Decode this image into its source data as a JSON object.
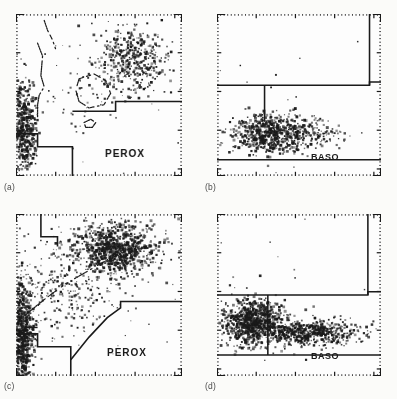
{
  "figure": {
    "background_color": "#fbfbf9",
    "ink_color": "#1a1a1a",
    "layout": "2x2 grid of scatter cytograms"
  },
  "panels": [
    {
      "id": "a",
      "caption": "(a)",
      "channel_label": "PEROX",
      "description": "Peroxidase cytogram, normal-type sample"
    },
    {
      "id": "b",
      "caption": "(b)",
      "channel_label": "BASO",
      "description": "Basophil/lobularity cytogram, normal-type sample"
    },
    {
      "id": "c",
      "caption": "(c)",
      "channel_label": "PEROX",
      "description": "Peroxidase cytogram, abnormal sample"
    },
    {
      "id": "d",
      "caption": "(d)",
      "channel_label": "BASO",
      "description": "Basophil/lobularity cytogram, abnormal sample"
    }
  ],
  "chart_data": [
    {
      "type": "scatter",
      "panel": "a",
      "title": "(a) PEROX",
      "xlabel": "Peroxidase activity",
      "ylabel": "Light scatter (size)",
      "xlim": [
        0,
        100
      ],
      "ylim": [
        0,
        100
      ],
      "grid": false,
      "axis_style": "dotted tick border on all four sides",
      "clusters": [
        {
          "name": "lymphocytes",
          "cx": 5,
          "cy": 30,
          "sx": 3.5,
          "sy": 14,
          "n": 460,
          "density": "very-high"
        },
        {
          "name": "neutrophils",
          "cx": 70,
          "cy": 72,
          "sx": 11,
          "sy": 10,
          "n": 420,
          "density": "high"
        },
        {
          "name": "monocytes",
          "cx": 40,
          "cy": 48,
          "sx": 13,
          "sy": 9,
          "n": 40,
          "density": "low"
        },
        {
          "name": "noise",
          "cx": 45,
          "cy": 60,
          "sx": 28,
          "sy": 26,
          "n": 55,
          "density": "sparse"
        }
      ],
      "gates": [
        {
          "name": "lymph-mono-gate-step",
          "type": "polyline",
          "points": [
            [
              0,
              26
            ],
            [
              13,
              26
            ],
            [
              13,
              18
            ],
            [
              34,
              18
            ],
            [
              34,
              0
            ]
          ]
        },
        {
          "name": "noise-threshold-line",
          "type": "polyline",
          "points": [
            [
              34,
              40
            ],
            [
              60,
              40
            ],
            [
              60,
              46
            ],
            [
              100,
              46
            ]
          ]
        },
        {
          "name": "lmne-left-contour",
          "type": "polyline",
          "points": [
            [
              13,
              82
            ],
            [
              16,
              74
            ],
            [
              15,
              62
            ],
            [
              17,
              55
            ],
            [
              14,
              50
            ],
            [
              13,
              44
            ],
            [
              13,
              36
            ]
          ]
        },
        {
          "name": "upper-contour",
          "type": "polyline",
          "points": [
            [
              17,
              96
            ],
            [
              19,
              90
            ],
            [
              22,
              84
            ],
            [
              24,
              78
            ]
          ]
        },
        {
          "name": "mono-contour-loop",
          "type": "closed",
          "points": [
            [
              38,
              60
            ],
            [
              47,
              63
            ],
            [
              54,
              59
            ],
            [
              57,
              51
            ],
            [
              53,
              44
            ],
            [
              44,
              42
            ],
            [
              38,
              46
            ],
            [
              36,
              53
            ]
          ]
        },
        {
          "name": "small-contour-loop",
          "type": "closed",
          "points": [
            [
              41,
              33
            ],
            [
              45,
              35
            ],
            [
              48,
              33
            ],
            [
              46,
              30
            ],
            [
              42,
              30
            ]
          ]
        }
      ]
    },
    {
      "type": "scatter",
      "panel": "b",
      "title": "(b) BASO",
      "xlabel": "Light scatter (lobularity)",
      "ylabel": "Nuclear density",
      "xlim": [
        0,
        100
      ],
      "ylim": [
        0,
        100
      ],
      "grid": false,
      "axis_style": "dotted tick border on all four sides",
      "clusters": [
        {
          "name": "mononuclear-polymorphonuclear",
          "cx": 33,
          "cy": 26,
          "sx": 12,
          "sy": 6,
          "n": 620,
          "density": "very-high"
        },
        {
          "name": "tail",
          "cx": 55,
          "cy": 25,
          "sx": 13,
          "sy": 4,
          "n": 120,
          "density": "medium"
        },
        {
          "name": "noise",
          "cx": 45,
          "cy": 45,
          "sx": 30,
          "sy": 22,
          "n": 22,
          "density": "sparse"
        }
      ],
      "gates": [
        {
          "name": "baso-horizontal-gate",
          "type": "polyline",
          "points": [
            [
              0,
              56
            ],
            [
              93,
              56
            ],
            [
              93,
              58
            ],
            [
              100,
              58
            ]
          ]
        },
        {
          "name": "mn-pmn-divider",
          "type": "polyline",
          "points": [
            [
              29,
              56
            ],
            [
              29,
              34
            ]
          ]
        },
        {
          "name": "baso-vertical-gate",
          "type": "polyline",
          "points": [
            [
              93,
              100
            ],
            [
              93,
              56
            ]
          ]
        },
        {
          "name": "baso-baseline",
          "type": "polyline",
          "points": [
            [
              0,
              10
            ],
            [
              100,
              10
            ]
          ]
        }
      ]
    },
    {
      "type": "scatter",
      "panel": "c",
      "title": "(c) PEROX",
      "xlabel": "Peroxidase activity",
      "ylabel": "Light scatter (size)",
      "xlim": [
        0,
        100
      ],
      "ylim": [
        0,
        100
      ],
      "grid": false,
      "axis_style": "dotted tick border on all four sides",
      "clusters": [
        {
          "name": "lymphocytes",
          "cx": 4,
          "cy": 26,
          "sx": 3.5,
          "sy": 18,
          "n": 700,
          "density": "very-high"
        },
        {
          "name": "neutrophils",
          "cx": 60,
          "cy": 78,
          "sx": 13,
          "sy": 8,
          "n": 800,
          "density": "very-high"
        },
        {
          "name": "diagonal-band",
          "cx": 28,
          "cy": 55,
          "sx": 16,
          "sy": 14,
          "n": 260,
          "density": "medium"
        },
        {
          "name": "noise",
          "cx": 48,
          "cy": 55,
          "sx": 30,
          "sy": 26,
          "n": 60,
          "density": "sparse"
        }
      ],
      "gates": [
        {
          "name": "lymph-gate-step",
          "type": "polyline",
          "points": [
            [
              0,
              26
            ],
            [
              13,
              26
            ],
            [
              13,
              18
            ],
            [
              33,
              18
            ],
            [
              33,
              0
            ]
          ]
        },
        {
          "name": "upper-gate-step",
          "type": "polyline",
          "points": [
            [
              15,
              100
            ],
            [
              15,
              86
            ],
            [
              25,
              86
            ],
            [
              25,
              80
            ]
          ]
        },
        {
          "name": "valley-dashed",
          "type": "polyline",
          "points": [
            [
              6,
              38
            ],
            [
              18,
              48
            ],
            [
              30,
              57
            ],
            [
              42,
              64
            ],
            [
              52,
              70
            ],
            [
              62,
              75
            ]
          ]
        },
        {
          "name": "lower-right-gate",
          "type": "polyline",
          "points": [
            [
              33,
              10
            ],
            [
              44,
              24
            ],
            [
              55,
              36
            ],
            [
              63,
              42
            ],
            [
              63,
              46
            ],
            [
              100,
              46
            ]
          ]
        },
        {
          "name": "left-tick",
          "type": "polyline",
          "points": [
            [
              6,
              30
            ],
            [
              13,
              30
            ]
          ]
        }
      ]
    },
    {
      "type": "scatter",
      "panel": "d",
      "title": "(d) BASO",
      "xlabel": "Light scatter (lobularity)",
      "ylabel": "Nuclear density",
      "xlim": [
        0,
        100
      ],
      "ylim": [
        0,
        100
      ],
      "grid": false,
      "axis_style": "dotted tick border on all four sides",
      "clusters": [
        {
          "name": "mononuclear",
          "cx": 22,
          "cy": 34,
          "sx": 9,
          "sy": 7,
          "n": 760,
          "density": "very-high"
        },
        {
          "name": "polymorphonuclear-band",
          "cx": 55,
          "cy": 27,
          "sx": 16,
          "sy": 4,
          "n": 640,
          "density": "high"
        },
        {
          "name": "noise",
          "cx": 50,
          "cy": 60,
          "sx": 28,
          "sy": 22,
          "n": 20,
          "density": "sparse"
        }
      ],
      "gates": [
        {
          "name": "baso-horizontal-gate",
          "type": "polyline",
          "points": [
            [
              0,
              50
            ],
            [
              92,
              50
            ],
            [
              92,
              52
            ],
            [
              100,
              52
            ]
          ]
        },
        {
          "name": "mn-pmn-divider",
          "type": "polyline",
          "points": [
            [
              31,
              50
            ],
            [
              31,
              13
            ]
          ]
        },
        {
          "name": "baso-vertical-gate",
          "type": "polyline",
          "points": [
            [
              92,
              100
            ],
            [
              92,
              50
            ]
          ]
        },
        {
          "name": "baso-baseline",
          "type": "polyline",
          "points": [
            [
              0,
              13
            ],
            [
              100,
              13
            ]
          ]
        }
      ]
    }
  ]
}
